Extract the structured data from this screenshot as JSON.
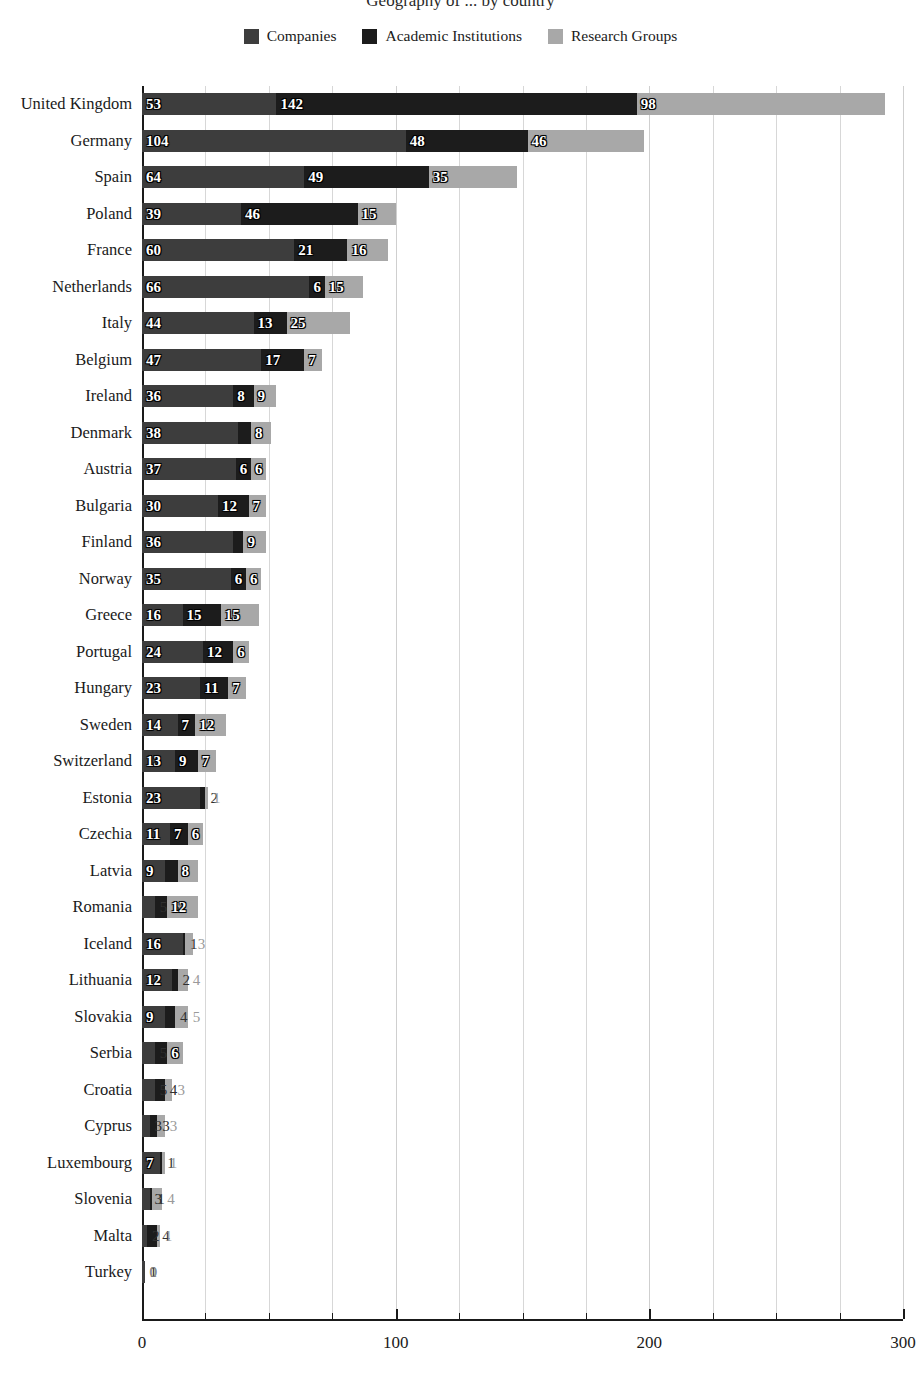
{
  "chart_data": {
    "type": "bar",
    "orientation": "horizontal",
    "stacked": true,
    "title": "Geography of ... by country",
    "xlabel": "",
    "ylabel": "",
    "xlim": [
      0,
      300
    ],
    "xticks": [
      0,
      100,
      200,
      300
    ],
    "xtick_labels": [
      "0",
      "100",
      "200",
      "300"
    ],
    "minor_tick_step": 25,
    "grid": true,
    "legend_position": "top-center",
    "series": [
      {
        "name": "Companies",
        "color": "#3d3d3d",
        "values": [
          53,
          104,
          64,
          39,
          60,
          66,
          44,
          47,
          36,
          38,
          37,
          30,
          36,
          35,
          16,
          24,
          23,
          14,
          13,
          23,
          11,
          9,
          5,
          16,
          12,
          9,
          5,
          5,
          3,
          7,
          3,
          2,
          1
        ]
      },
      {
        "name": "Academic Institutions",
        "color": "#1c1c1c",
        "values": [
          142,
          48,
          49,
          46,
          21,
          6,
          13,
          17,
          8,
          5,
          6,
          12,
          4,
          6,
          15,
          12,
          11,
          7,
          9,
          2,
          7,
          5,
          5,
          1,
          2,
          4,
          5,
          4,
          3,
          1,
          1,
          4,
          0
        ]
      },
      {
        "name": "Research Groups",
        "color": "#a8a8a8",
        "values": [
          98,
          46,
          35,
          15,
          16,
          15,
          25,
          7,
          9,
          8,
          6,
          7,
          9,
          6,
          15,
          6,
          7,
          12,
          7,
          1,
          6,
          8,
          12,
          3,
          4,
          5,
          6,
          3,
          3,
          1,
          4,
          1,
          0
        ]
      }
    ],
    "categories": [
      "United Kingdom",
      "Germany",
      "Spain",
      "Poland",
      "France",
      "Netherlands",
      "Italy",
      "Belgium",
      "Ireland",
      "Denmark",
      "Austria",
      "Bulgaria",
      "Finland",
      "Norway",
      "Greece",
      "Portugal",
      "Hungary",
      "Sweden",
      "Switzerland",
      "Estonia",
      "Czechia",
      "Latvia",
      "Romania",
      "Iceland",
      "Lithuania",
      "Slovakia",
      "Serbia",
      "Croatia",
      "Cyprus",
      "Luxembourg",
      "Slovenia",
      "Malta",
      "Turkey"
    ]
  },
  "legend": {
    "items": [
      {
        "label": "Companies",
        "color": "#3d3d3d"
      },
      {
        "label": "Academic Institutions",
        "color": "#1c1c1c"
      },
      {
        "label": "Research Groups",
        "color": "#a8a8a8"
      }
    ]
  }
}
